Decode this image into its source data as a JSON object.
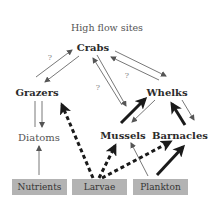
{
  "diagram": {
    "title": "High flow sites",
    "nodes": {
      "crabs": "Crabs",
      "grazers": "Grazers",
      "whelks": "Whelks",
      "diatoms": "Diatoms",
      "mussels": "Mussels",
      "barnacles": "Barnacles"
    },
    "sources": {
      "nutrients": "Nutrients",
      "larvae": "Larvae",
      "plankton": "Plankton"
    },
    "question_marks": [
      "?",
      "?",
      "?"
    ],
    "colors": {
      "box_fill": "#b3b3b3",
      "arrow_thin": "#555555",
      "arrow_thick": "#1a1a1a"
    },
    "edges": [
      {
        "from": "Grazers",
        "to": "Crabs",
        "style": "thin",
        "label": "?"
      },
      {
        "from": "Crabs",
        "to": "Grazers",
        "style": "thin"
      },
      {
        "from": "Crabs",
        "to": "Whelks",
        "style": "thin"
      },
      {
        "from": "Whelks",
        "to": "Crabs",
        "style": "thin",
        "label": "?"
      },
      {
        "from": "Mussels",
        "to": "Crabs",
        "style": "thin",
        "label": "?"
      },
      {
        "from": "Crabs",
        "to": "Mussels",
        "style": "thin"
      },
      {
        "from": "Grazers",
        "to": "Diatoms",
        "style": "thin"
      },
      {
        "from": "Diatoms",
        "to": "Grazers",
        "style": "thin"
      },
      {
        "from": "Nutrients",
        "to": "Diatoms",
        "style": "thin"
      },
      {
        "from": "Mussels",
        "to": "Whelks",
        "style": "thick"
      },
      {
        "from": "Whelks",
        "to": "Mussels",
        "style": "thin"
      },
      {
        "from": "Barnacles",
        "to": "Whelks",
        "style": "thick"
      },
      {
        "from": "Whelks",
        "to": "Barnacles",
        "style": "thin"
      },
      {
        "from": "Larvae",
        "to": "Grazers",
        "style": "dashed"
      },
      {
        "from": "Larvae",
        "to": "Mussels",
        "style": "dashed"
      },
      {
        "from": "Larvae",
        "to": "Barnacles",
        "style": "dashed"
      },
      {
        "from": "Plankton",
        "to": "Mussels",
        "style": "thin"
      },
      {
        "from": "Plankton",
        "to": "Barnacles",
        "style": "thick"
      }
    ]
  }
}
